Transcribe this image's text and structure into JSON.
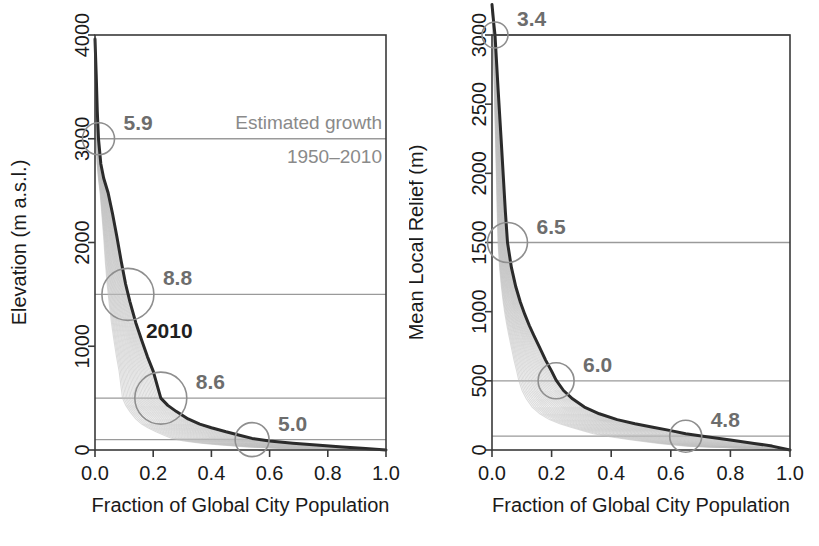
{
  "figure": {
    "panels": [
      {
        "id": "left",
        "ylabel": "Elevation (m a.s.l.)",
        "xlabel": "Fraction of Global City Population",
        "yticks": [
          "0",
          "1000",
          "2000",
          "3000",
          "4000"
        ],
        "xticks": [
          "0.0",
          "0.2",
          "0.4",
          "0.6",
          "0.8",
          "1.0"
        ],
        "annotation_line1": "Estimated growth",
        "annotation_line2": "1950–2010",
        "curve_label": "2010",
        "bubbles": [
          {
            "label": "5.9",
            "level": 3000,
            "fraction": 0.012
          },
          {
            "label": "8.8",
            "level": 1500,
            "fraction": 0.113
          },
          {
            "label": "8.6",
            "level": 500,
            "fraction": 0.226
          },
          {
            "label": "5.0",
            "level": 100,
            "fraction": 0.54
          }
        ]
      },
      {
        "id": "right",
        "ylabel": "Mean Local Relief (m)",
        "xlabel": "Fraction of Global City Population",
        "yticks": [
          "0",
          "500",
          "1000",
          "1500",
          "2000",
          "2500",
          "3000"
        ],
        "xticks": [
          "0.0",
          "0.2",
          "0.4",
          "0.6",
          "0.8",
          "1.0"
        ],
        "bubbles": [
          {
            "label": "3.4",
            "level": 3000,
            "fraction": 0.01
          },
          {
            "label": "6.5",
            "level": 1500,
            "fraction": 0.052
          },
          {
            "label": "6.0",
            "level": 500,
            "fraction": 0.215
          },
          {
            "label": "4.8",
            "level": 100,
            "fraction": 0.65
          }
        ]
      }
    ]
  },
  "colors": {
    "axis": "#3a3a3a",
    "main_curve": "#2b2b2b",
    "ghost_curves": "#bdbdbd",
    "reference_line": "#9a9a9a",
    "bubble_stroke": "#8e8e8e",
    "bubble_label": "#6d6d6d",
    "annotation": "#8a8a8a"
  },
  "chart_data": [
    {
      "type": "line",
      "title": "",
      "xlabel": "Fraction of Global City Population",
      "ylabel": "Elevation (m a.s.l.)",
      "xlim": [
        0.0,
        1.0
      ],
      "ylim": [
        0,
        4000
      ],
      "grid": false,
      "legend": "none",
      "annotations": [
        "Estimated growth",
        "1950–2010",
        "2010"
      ],
      "reference_lines_y": [
        3000,
        1500,
        500,
        100
      ],
      "bubble_labels": [
        "5.9",
        "8.8",
        "8.6",
        "5.0"
      ],
      "series": [
        {
          "name": "2010",
          "x": [
            0.0,
            0.004,
            0.008,
            0.012,
            0.02,
            0.03,
            0.045,
            0.06,
            0.075,
            0.09,
            0.105,
            0.12,
            0.14,
            0.16,
            0.18,
            0.2,
            0.226,
            0.25,
            0.28,
            0.32,
            0.36,
            0.4,
            0.45,
            0.5,
            0.54,
            0.6,
            0.68,
            0.76,
            0.85,
            0.93,
            1.0
          ],
          "y": [
            3960,
            3620,
            3260,
            3000,
            2760,
            2620,
            2480,
            2280,
            2060,
            1820,
            1600,
            1430,
            1230,
            1060,
            900,
            760,
            500,
            430,
            370,
            300,
            250,
            215,
            175,
            140,
            112,
            88,
            66,
            48,
            30,
            14,
            0
          ]
        }
      ],
      "ghost_series_note": "bundle of light-gray exceedance curves for years 1950 through 2009, shifted progressively left of the 2010 curve"
    },
    {
      "type": "line",
      "title": "",
      "xlabel": "Fraction of Global City Population",
      "ylabel": "Mean Local Relief (m)",
      "xlim": [
        0.0,
        1.0
      ],
      "ylim": [
        0,
        3000
      ],
      "grid": false,
      "legend": "none",
      "reference_lines_y": [
        3000,
        1500,
        500,
        100
      ],
      "bubble_labels": [
        "3.4",
        "6.5",
        "6.0",
        "4.8"
      ],
      "series": [
        {
          "name": "2010",
          "x": [
            0.0,
            0.006,
            0.01,
            0.02,
            0.032,
            0.045,
            0.052,
            0.065,
            0.08,
            0.095,
            0.11,
            0.125,
            0.14,
            0.16,
            0.18,
            0.2,
            0.215,
            0.24,
            0.27,
            0.31,
            0.36,
            0.42,
            0.48,
            0.54,
            0.6,
            0.65,
            0.72,
            0.8,
            0.88,
            0.94,
            1.0
          ],
          "y": [
            3220,
            3080,
            3000,
            2620,
            2200,
            1720,
            1500,
            1320,
            1180,
            1070,
            980,
            900,
            830,
            740,
            650,
            570,
            505,
            430,
            370,
            310,
            262,
            220,
            190,
            165,
            140,
            118,
            96,
            72,
            48,
            28,
            0
          ]
        }
      ],
      "ghost_series_note": "bundle of light-gray exceedance curves for years 1950 through 2009, shifted progressively left of the 2010 curve"
    }
  ]
}
